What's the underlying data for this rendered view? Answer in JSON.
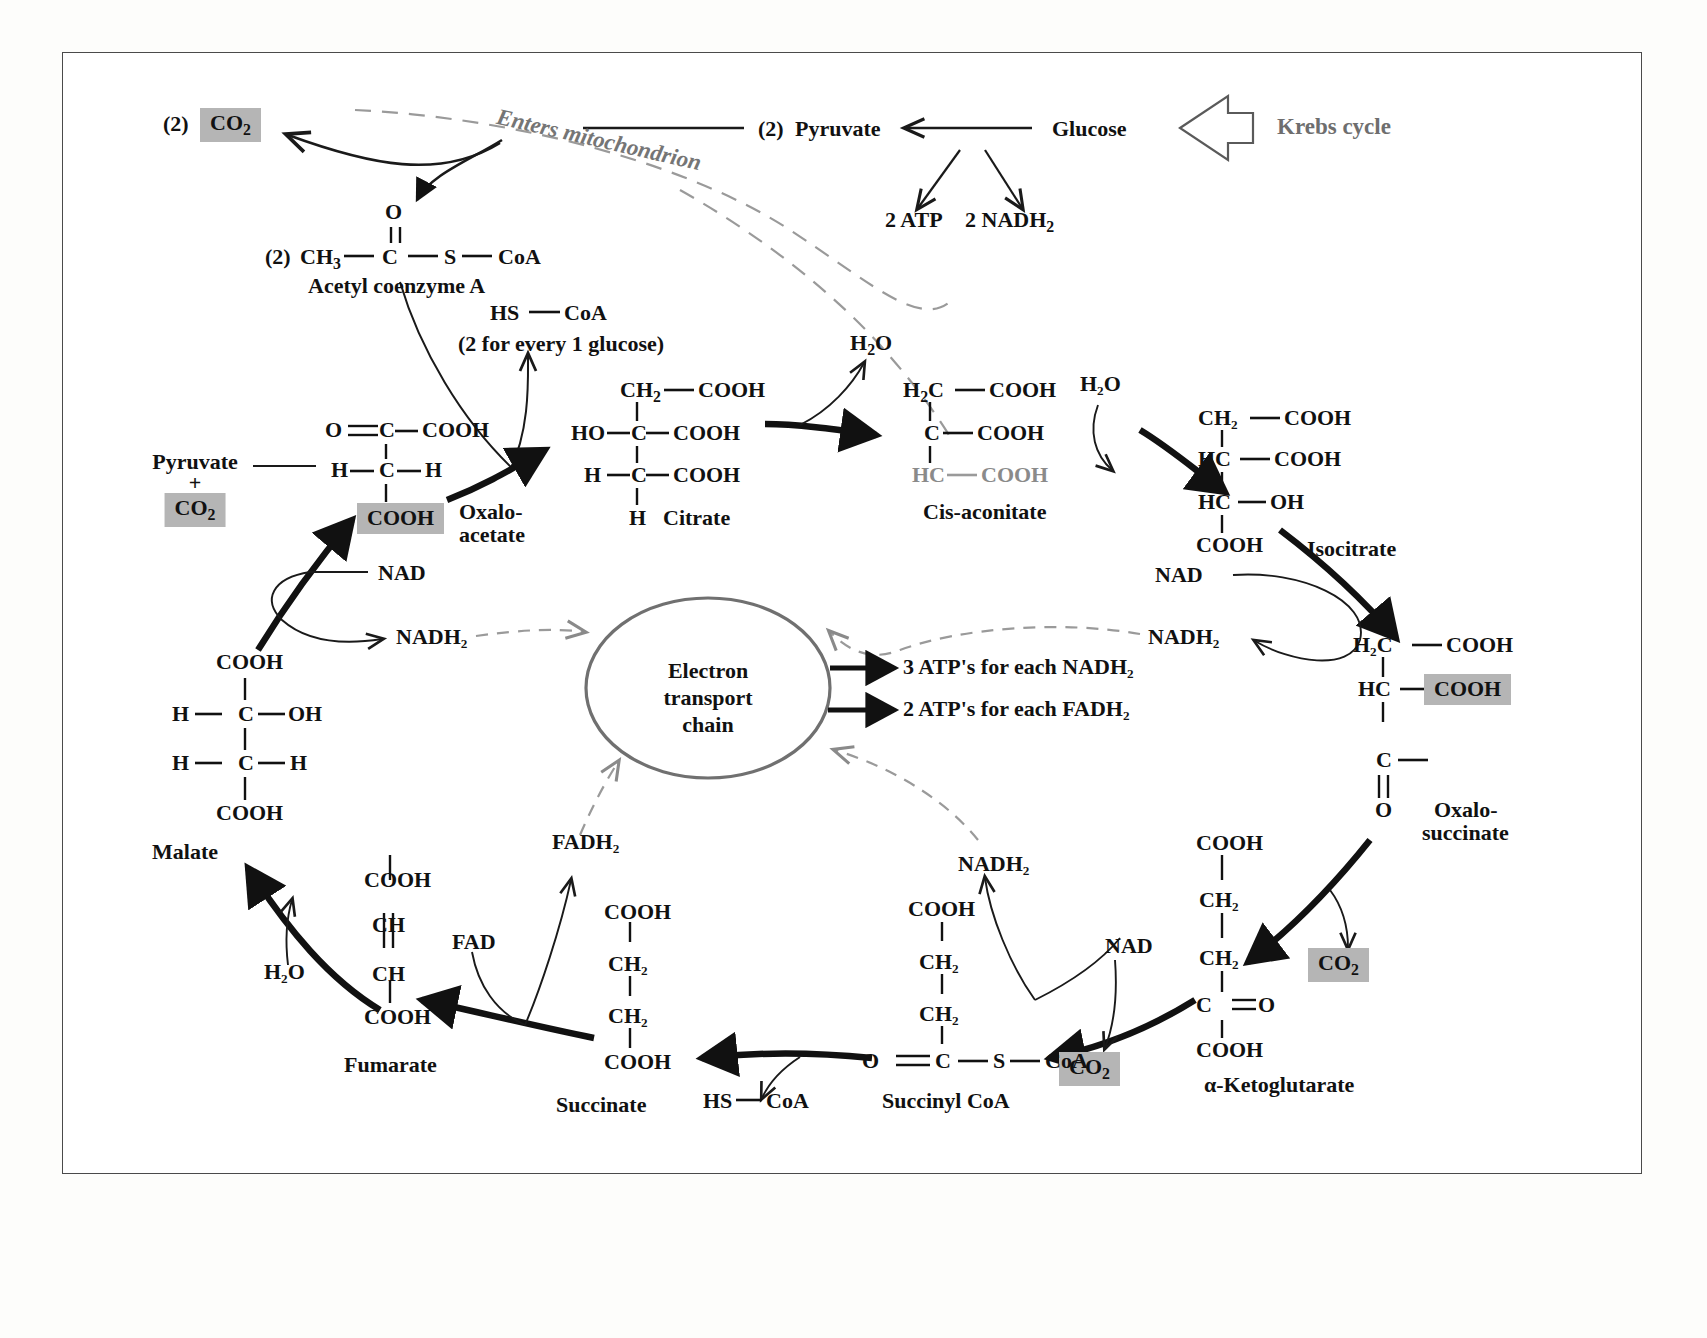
{
  "figure": {
    "title_badge": "Krebs cycle",
    "mitochondrion_label": "Enters mitochondrion",
    "etc_label_line1": "Electron",
    "etc_label_line2": "transport",
    "etc_label_line3": "chain",
    "colors": {
      "highlight_bg": "#b5b5b5",
      "gray_text": "#8a8a8a",
      "ink": "#111111",
      "frame": "#4a4a4a"
    }
  },
  "glycolysis": {
    "glucose": "Glucose",
    "pyruvate_count": "(2)",
    "pyruvate": "Pyruvate",
    "atp_yield": "2 ATP",
    "nadh_yield": "2 NADH₂",
    "nadh_yield_base": "2 NADH",
    "nadh_yield_sub": "2"
  },
  "acetyl": {
    "co2_count": "(2)",
    "co2": "CO₂",
    "co2_base": "CO",
    "co2_sub": "2",
    "count": "(2)",
    "ch3": "CH",
    "ch3_sub": "3",
    "o_top": "O",
    "c": "C",
    "s": "S",
    "coa": "CoA",
    "name": "Acetyl coenzyme A"
  },
  "hscoa": {
    "hs": "HS",
    "coa": "CoA",
    "note": "(2 for every 1 glucose)"
  },
  "oxaloacetate": {
    "name_line1": "Oxalo-",
    "name_line2": "acetate",
    "input_line1": "Pyruvate",
    "input_plus": "+",
    "input_co2": "CO₂",
    "input_co2_base": "CO",
    "input_co2_sub": "2",
    "atoms": {
      "o": "O",
      "c1": "C",
      "cooh_top": "COOH",
      "h_left": "H",
      "c2": "C",
      "h_right": "H",
      "cooh_bottom": "COOH"
    }
  },
  "citrate": {
    "name": "Citrate",
    "atoms": {
      "ch2": "CH₂",
      "ch2_base": "CH",
      "ch2_sub": "2",
      "cooh_1": "COOH",
      "ho": "HO",
      "c1": "C",
      "cooh_2": "COOH",
      "h_left": "H",
      "c2": "C",
      "cooh_3": "COOH",
      "h_bottom": "H"
    }
  },
  "cis_aconitate": {
    "name": "Cis-aconitate",
    "water_out": "H₂O",
    "water_out_base": "H",
    "water_out_sub": "2",
    "water_out_tail": "O",
    "atoms": {
      "h2c": "H₂C",
      "h2c_base": "H",
      "h2c_sub": "2",
      "h2c_tail": "C",
      "cooh_1": "COOH",
      "c": "C",
      "cooh_2": "COOH",
      "hc": "HC",
      "cooh_3": "COOH"
    }
  },
  "isocitrate": {
    "name": "Isocitrate",
    "water_in": "H₂O",
    "atoms": {
      "ch2": "CH₂",
      "cooh_1": "COOH",
      "hc_1": "HC",
      "cooh_2": "COOH",
      "hc_2": "HC",
      "oh": "OH",
      "cooh_3": "COOH"
    }
  },
  "oxalosuccinate": {
    "name_line1": "Oxalo-",
    "name_line2": "succinate",
    "atoms": {
      "h2c": "H₂C",
      "cooh_1": "COOH",
      "hc": "HC",
      "cooh_hl": "COOH",
      "c": "C",
      "o": "O"
    },
    "co2_out": "CO₂"
  },
  "ketoglutarate": {
    "name": "α-Ketoglutarate",
    "nad": "NAD",
    "nadh2": "NADH₂",
    "co2_out": "CO₂",
    "atoms": {
      "cooh_top": "COOH",
      "ch2_1": "CH₂",
      "ch2_2": "CH₂",
      "c": "C",
      "o": "O",
      "cooh_bottom": "COOH"
    }
  },
  "succinyl_coa": {
    "name": "Succinyl CoA",
    "hs": "HS",
    "hs_coa": "CoA",
    "atoms": {
      "o": "O",
      "c": "C",
      "s": "S",
      "coa": "CoA",
      "ch2_1": "CH₂",
      "ch2_2": "CH₂",
      "cooh": "COOH"
    }
  },
  "succinate": {
    "name": "Succinate",
    "atoms": {
      "cooh_top": "COOH",
      "ch2_1": "CH₂",
      "ch2_2": "CH₂",
      "cooh_bottom": "COOH"
    }
  },
  "fumarate": {
    "name": "Fumarate",
    "fad": "FAD",
    "fadh2": "FADH₂",
    "atoms": {
      "cooh_top": "COOH",
      "ch_1": "CH",
      "ch_2": "CH",
      "cooh_bottom": "COOH"
    }
  },
  "malate": {
    "name": "Malate",
    "water_in": "H₂O",
    "nad": "NAD",
    "nadh2": "NADH₂",
    "atoms": {
      "cooh_top": "COOH",
      "h_left_1": "H",
      "c1": "C",
      "oh": "OH",
      "h_left_2": "H",
      "c2": "C",
      "h_right": "H",
      "cooh_bottom": "COOH"
    }
  },
  "etc_outputs": {
    "nadh_atp_count": "3 ATP's",
    "nadh_atp_rest": "for each NADH₂",
    "fadh_atp_count": "2 ATP's",
    "fadh_atp_rest": "for each FADH₂",
    "nadh2_right": "NADH₂",
    "nadh2_bottom": "NADH₂"
  }
}
